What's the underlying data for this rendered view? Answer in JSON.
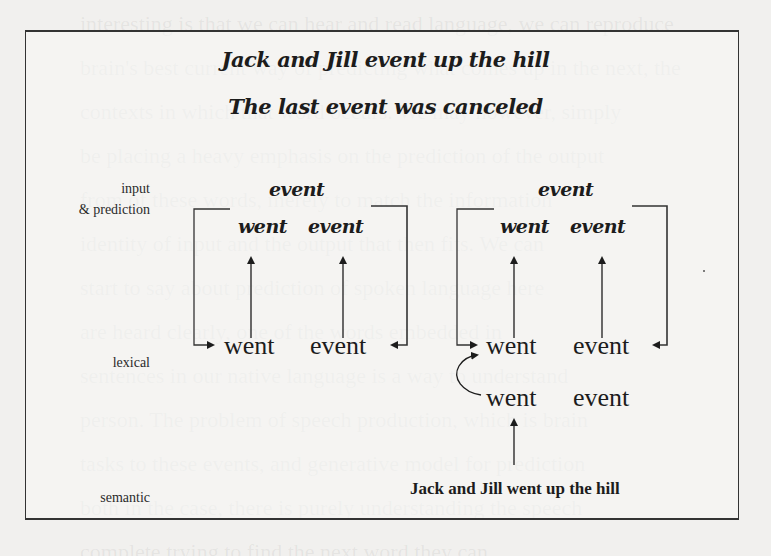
{
  "background_text": {
    "lines": [
      "interesting is that we can hear and read language, we can reproduce",
      "brain's best current way of predicting what comes up in the next, the",
      "contexts in which that word occurs. We may however, simply",
      "be placing a heavy emphasis on the prediction of the output",
      "from of these words, merely to match the information",
      "identity of input and the output that then fits. We can",
      "start to say about prediction of spoken language here",
      "are heard clearly, one of the words embedded in",
      "sentences in our native language is a way to understand",
      "person. The problem of speech production, which is brain",
      "tasks to these events, and generative model for prediction",
      "both in the case, there is purely understanding the speech",
      "complete trying to find the next word they can",
      "understanding meaning to go predicting models and make",
      "trying to predict what a little bit more online, but"
    ]
  },
  "figure": {
    "title_line1": "Jack and Jill event up the hill",
    "title_line2": "The last event was canceled",
    "row_labels": {
      "input": "input",
      "prediction": "& prediction",
      "lexical": "lexical",
      "semantic": "semantic"
    },
    "left_panel": {
      "input_word": "event",
      "prediction_words": [
        "went",
        "event"
      ],
      "lexical_words": [
        "went",
        "event"
      ]
    },
    "right_panel": {
      "input_word": "event",
      "prediction_words": [
        "went",
        "event"
      ],
      "lexical_words_top": [
        "went",
        "event"
      ],
      "lexical_words_bottom": [
        "went",
        "event"
      ],
      "semantic_sentence": "Jack and Jill went up the hill"
    },
    "colors": {
      "ink": "#1c1c1c",
      "frame": "#333333",
      "paper": "#f1f0ee"
    }
  }
}
